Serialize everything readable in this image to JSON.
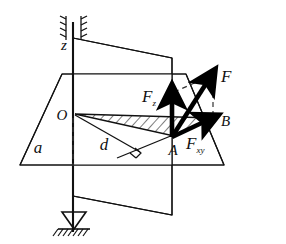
{
  "figure": {
    "background_color": "#ffffff",
    "line_color": "#111111",
    "vector_color": "#000000",
    "dashed_color": "#333333"
  },
  "labels": {
    "axis_z": "z",
    "origin_O": "O",
    "point_A": "A",
    "point_B": "B",
    "plane_a": "a",
    "distance_d": "d",
    "force_F": "F",
    "force_Fz_base": "F",
    "force_Fz_sub": "z",
    "force_Fxy_base": "F",
    "force_Fxy_sub": "xy"
  },
  "elements": {
    "horizontal_plane": "horizontal-plane-parallelogram",
    "vertical_plane": "vertical-plane-quadrilateral",
    "shaft_axis": "vertical-shaft-axis",
    "top_bearing": "top-journal-bearing-hatched",
    "bottom_bearing": "bottom-thrust-bearing-hatched",
    "moment_triangle": "hatched-triangle-OAB",
    "right_angle_marker": "right-angle-square-at-d",
    "construction_lines": "dashed-parallelogram-and-projection"
  },
  "geometry": {
    "origin": [
      73,
      115
    ],
    "point_A": [
      172,
      137
    ],
    "point_B": [
      212,
      118
    ],
    "force_tip": [
      213,
      75
    ],
    "fz_tip": [
      172,
      92
    ],
    "shaft_top": [
      73,
      22
    ],
    "shaft_bottom": [
      73,
      232
    ]
  }
}
